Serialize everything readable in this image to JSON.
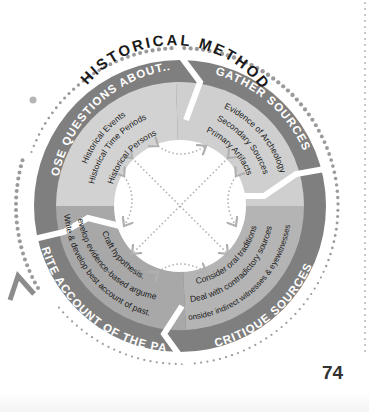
{
  "title": "HISTORICAL METHOD",
  "page_number": "74",
  "colors": {
    "band": "#7f7f7f",
    "segment_light": "#d2d2d2",
    "segment_dark": "#a8a8a8",
    "center": "#ffffff",
    "dots": "#9a9a9a",
    "arrows": "#b0b0b0",
    "text_dark": "#1a1a1a",
    "text_light": "#ffffff"
  },
  "segments": [
    {
      "id": "pose",
      "label": "POSE QUESTIONS ABOUT...",
      "items": [
        "Historical Events",
        "Historical Time Periods",
        "Historical Persons"
      ]
    },
    {
      "id": "gather",
      "label": "GATHER SOURCES",
      "items": [
        "Evidence of Archeology",
        "Secondary Sources",
        "Primary Artifacts"
      ]
    },
    {
      "id": "critique",
      "label": "CRITIQUE SOURCES",
      "items": [
        "Consider oral traditions",
        "Deal with contradictory sources",
        "Consider indirect witnesses & eyewitnesses."
      ]
    },
    {
      "id": "write",
      "label": "WRITE ACCOUNT OF THE PAST",
      "items": [
        "Craft hypothesis.",
        "Develop evidence-based argument.",
        "Write & develop best account of past."
      ]
    }
  ]
}
